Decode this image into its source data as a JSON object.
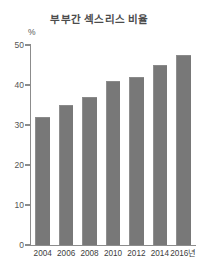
{
  "chart_data": {
    "type": "bar",
    "title": "부부간 섹스리스 비율",
    "xlabel": "",
    "ylabel": "%",
    "categories": [
      "2004",
      "2006",
      "2008",
      "2010",
      "2012",
      "2014",
      "2016년"
    ],
    "values": [
      32,
      35,
      37,
      41,
      42,
      45,
      47.5
    ],
    "ylim": [
      0,
      50
    ],
    "yticks": [
      "0",
      "10",
      "20",
      "30",
      "40",
      "50"
    ],
    "ytick_values": [
      0,
      10,
      20,
      30,
      40,
      50
    ],
    "grid": false,
    "legend": false,
    "bar_color": "#787878",
    "axis_color": "#8c8c8c",
    "title_color": "#4c4c4c"
  }
}
